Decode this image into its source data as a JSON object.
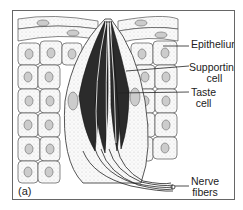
{
  "figure": {
    "panel_label": "(a)",
    "labels": {
      "epithelium": "Epithelium",
      "supporting_cell_line1": "Supporting",
      "supporting_cell_line2": "cell",
      "taste_cell_line1": "Taste",
      "taste_cell_line2": "cell",
      "nerve_fibers_line1": "Nerve",
      "nerve_fibers_line2": "fibers"
    }
  }
}
